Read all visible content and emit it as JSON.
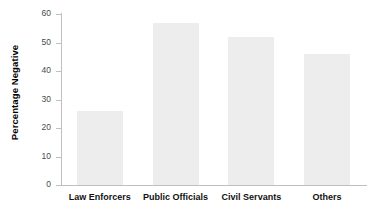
{
  "chart_data": {
    "type": "bar",
    "title": "",
    "xlabel": "",
    "ylabel": "Percentage Negative",
    "categories": [
      "Law Enforcers",
      "Public Officials",
      "Civil Servants",
      "Others"
    ],
    "values": [
      26,
      57,
      52,
      46
    ],
    "ylim": [
      0,
      60
    ],
    "yticks": [
      0,
      10,
      20,
      30,
      40,
      50,
      60
    ],
    "ytick_labels": [
      "0",
      "10",
      "20",
      "30",
      "40",
      "50",
      "60"
    ],
    "grid": false,
    "legend": false,
    "bar_color": "#ededed",
    "axis_color": "#bfbfbf",
    "text_color": "#111111"
  }
}
